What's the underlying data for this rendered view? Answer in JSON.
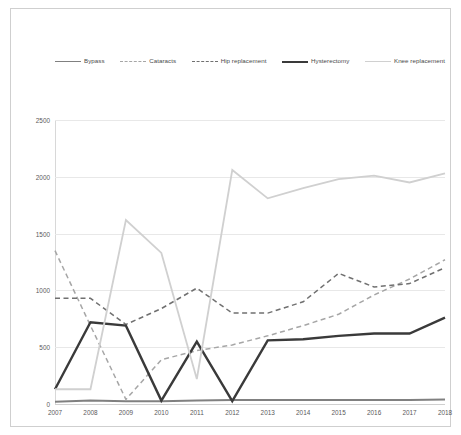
{
  "chart_data": {
    "type": "line",
    "title": "",
    "xlabel": "",
    "ylabel": "",
    "categories": [
      "2007",
      "2008",
      "2009",
      "2010",
      "2011",
      "2012",
      "2013",
      "2014",
      "2015",
      "2016",
      "2017",
      "2018"
    ],
    "ylim": [
      0,
      2500
    ],
    "yticks": [
      0,
      500,
      1000,
      1500,
      2000,
      2500
    ],
    "grid": true,
    "legend_position": "top",
    "series": [
      {
        "name": "Bypass",
        "color": "#808080",
        "style": "solid",
        "width": 2.0,
        "values": [
          20,
          30,
          25,
          25,
          30,
          35,
          35,
          35,
          35,
          35,
          35,
          40
        ]
      },
      {
        "name": "Cataracts",
        "color": "#a6a6a6",
        "style": "dashed",
        "width": 1.5,
        "values": [
          1350,
          690,
          40,
          390,
          470,
          520,
          600,
          690,
          790,
          960,
          1100,
          1270
        ]
      },
      {
        "name": "Hip replacement",
        "color": "#707070",
        "style": "dashed",
        "width": 1.5,
        "values": [
          930,
          930,
          700,
          840,
          1020,
          800,
          800,
          900,
          1150,
          1030,
          1060,
          1200
        ]
      },
      {
        "name": "Hysterectomy",
        "color": "#3a3a3a",
        "style": "solid",
        "width": 2.4,
        "values": [
          130,
          720,
          690,
          30,
          550,
          25,
          560,
          570,
          600,
          620,
          620,
          760
        ]
      },
      {
        "name": "Knee replacement",
        "color": "#d0d0d0",
        "style": "solid",
        "width": 1.8,
        "values": [
          130,
          130,
          1620,
          1330,
          220,
          2060,
          1810,
          1900,
          1980,
          2010,
          1950,
          2030
        ]
      }
    ]
  }
}
